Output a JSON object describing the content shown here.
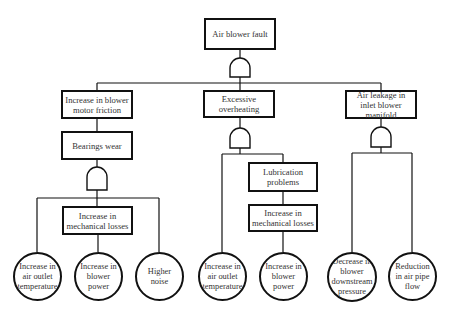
{
  "diagram": {
    "type": "fault-tree",
    "top_event": {
      "label": "Air blower fault",
      "gate": "AND"
    },
    "branches": [
      {
        "label": "Increase in blower motor friction",
        "children": [
          {
            "label": "Bearings wear",
            "gate": "AND",
            "children": [
              {
                "label": "Increase in air outlet temperature",
                "kind": "basic-event"
              },
              {
                "label": "Increase in mechanical losses",
                "kind": "intermediate-event",
                "children": [
                  {
                    "label": "Increase in blower power",
                    "kind": "basic-event"
                  }
                ]
              },
              {
                "label": "Higher noise",
                "kind": "basic-event"
              }
            ]
          }
        ]
      },
      {
        "label": "Excessive overheating",
        "gate": "AND",
        "children": [
          {
            "label": "Increase in air outlet temperature",
            "kind": "basic-event"
          },
          {
            "label": "Lubrication problems",
            "kind": "intermediate-event",
            "children": [
              {
                "label": "Increase in mechanical losses",
                "kind": "intermediate-event",
                "children": [
                  {
                    "label": "Increase in blower power",
                    "kind": "basic-event"
                  }
                ]
              }
            ]
          }
        ]
      },
      {
        "label": "Air leakage in inlet blower manifold",
        "gate": "AND",
        "children": [
          {
            "label": "Decrease in blower downstream pressure",
            "kind": "basic-event"
          },
          {
            "label": "Reduction in air pipe flow",
            "kind": "basic-event"
          }
        ]
      }
    ]
  },
  "labels": {
    "top": "Air blower fault",
    "b1": "Increase in blower motor friction",
    "b1_bearings": "Bearings wear",
    "b1_mech": "Increase in mechanical losses",
    "b1_c1": "Increase in air outlet temperature",
    "b1_c2": "Increase in blower power",
    "b1_c3": "Higher noise",
    "b2": "Excessive overheating",
    "b2_lub": "Lubrication problems",
    "b2_mech": "Increase in mechanical losses",
    "b2_c1": "Increase in air outlet temperature",
    "b2_c2": "Increase in blower power",
    "b3": "Air leakage in inlet blower manifold",
    "b3_c1": "Decrease in blower downstream pressure",
    "b3_c2": "Reduction in air pipe flow"
  },
  "colors": {
    "line": "#111111",
    "text": "#333333",
    "background": "#ffffff"
  }
}
